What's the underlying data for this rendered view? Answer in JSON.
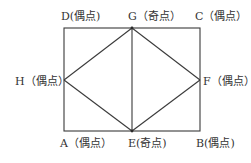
{
  "diagram": {
    "type": "graph-figure",
    "stroke_color": "#3a3a3a",
    "text_color": "#333333",
    "vertices": {
      "A": {
        "name": "A",
        "kind": "偶点",
        "label": "A（偶点）",
        "x": 64,
        "y": 131
      },
      "B": {
        "name": "B",
        "kind": "偶点",
        "label": "B(偶点)",
        "x": 200,
        "y": 131
      },
      "C": {
        "name": "C",
        "kind": "偶点",
        "label": "C（偶点）",
        "x": 200,
        "y": 28
      },
      "D": {
        "name": "D",
        "kind": "偶点",
        "label": "D(偶点)",
        "x": 64,
        "y": 28
      },
      "E": {
        "name": "E",
        "kind": "奇点",
        "label": "E(奇点)",
        "x": 132,
        "y": 131
      },
      "F": {
        "name": "F",
        "kind": "偶点",
        "label": "F（偶点）",
        "x": 200,
        "y": 80
      },
      "G": {
        "name": "G",
        "kind": "奇点",
        "label": "G（奇点）",
        "x": 132,
        "y": 28
      },
      "H": {
        "name": "H",
        "kind": "偶点",
        "label": "H（偶点）",
        "x": 64,
        "y": 80
      }
    },
    "edges": [
      [
        "A",
        "E"
      ],
      [
        "E",
        "B"
      ],
      [
        "B",
        "F"
      ],
      [
        "F",
        "C"
      ],
      [
        "C",
        "G"
      ],
      [
        "G",
        "D"
      ],
      [
        "D",
        "H"
      ],
      [
        "H",
        "A"
      ],
      [
        "G",
        "H"
      ],
      [
        "H",
        "E"
      ],
      [
        "E",
        "F"
      ],
      [
        "F",
        "G"
      ],
      [
        "G",
        "E"
      ]
    ]
  }
}
